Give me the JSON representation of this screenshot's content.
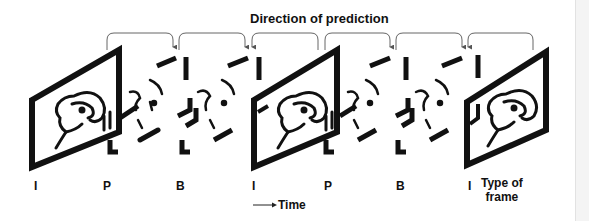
{
  "diagram": {
    "title": "Direction of prediction",
    "time_label": "Time",
    "legend_label_line1": "Type of",
    "legend_label_line2": "frame",
    "frame_types": [
      "I",
      "P",
      "B",
      "I",
      "P",
      "B",
      "I"
    ],
    "frame_type_x": [
      36,
      104,
      178,
      252,
      325,
      398,
      469
    ],
    "colors": {
      "ink": "#111111",
      "arrow": "#555555",
      "background": "#ffffff",
      "scrollbar": "#f4f4f4"
    },
    "prediction_arcs": [
      {
        "from": "I",
        "to": "B",
        "x1": 107,
        "x2": 173,
        "arrow_at": "right"
      },
      {
        "from": "B",
        "to": "P",
        "x1": 179,
        "x2": 245,
        "arrow_at": "right"
      },
      {
        "from": "I",
        "to": "P",
        "x1": 252,
        "x2": 318,
        "arrow_at": "left"
      },
      {
        "from": "I",
        "to": "B",
        "x1": 325,
        "x2": 390,
        "arrow_at": "right"
      },
      {
        "from": "B",
        "to": "P",
        "x1": 396,
        "x2": 462,
        "arrow_at": "right"
      },
      {
        "from": "I",
        "to": "P",
        "x1": 468,
        "x2": 533,
        "arrow_at": "left"
      }
    ]
  }
}
